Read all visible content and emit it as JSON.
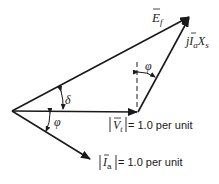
{
  "diagram": {
    "type": "phasor-diagram",
    "phasors": [
      {
        "id": "Vt",
        "label_symbol": "V",
        "label_subscript": "t",
        "magnitude_text": "= 1.0 per unit",
        "from": [
          12,
          111
        ],
        "to": [
          138,
          112
        ]
      },
      {
        "id": "Ef",
        "label_symbol": "E",
        "label_subscript": "f",
        "from": [
          12,
          111
        ],
        "to": [
          190,
          16
        ]
      },
      {
        "id": "jIaXs",
        "label_prefix": "j",
        "label_symbol": "I",
        "label_subscript": "a",
        "label_suffix": "X",
        "label_suffix_subscript": "s",
        "from": [
          138,
          112
        ],
        "to": [
          190,
          16
        ]
      },
      {
        "id": "Ia",
        "label_symbol": "I",
        "label_subscript": "a",
        "magnitude_text": "= 1.0 per unit",
        "from": [
          12,
          111
        ],
        "to": [
          91,
          160
        ]
      }
    ],
    "angles": [
      {
        "id": "delta",
        "symbol": "δ",
        "between": [
          "Vt",
          "Ef"
        ]
      },
      {
        "id": "phi_origin",
        "symbol": "φ",
        "between": [
          "Vt",
          "Ia"
        ]
      },
      {
        "id": "phi_top",
        "symbol": "φ",
        "between": [
          "dashed-vertical",
          "jIaXs"
        ]
      }
    ],
    "colors": {
      "line": "#1a1a1a",
      "background": "#ffffff"
    }
  },
  "labels": {
    "ef": {
      "sym": "E",
      "sub": "f"
    },
    "jiaxs": {
      "pre": "j",
      "sym": "I",
      "sub": "a",
      "x": "X",
      "xsub": "s"
    },
    "vt": {
      "sym": "V",
      "sub": "t",
      "rest": "= 1.0 per unit"
    },
    "ia": {
      "sym": "I",
      "sub": "a",
      "rest": "= 1.0 per unit"
    },
    "delta": "δ",
    "phi1": "φ",
    "phi2": "φ"
  }
}
